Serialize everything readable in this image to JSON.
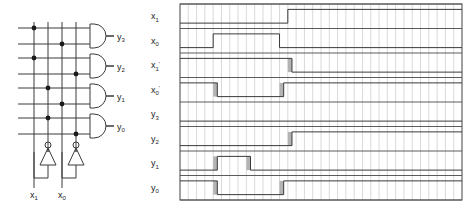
{
  "figure": {
    "title": "",
    "left_panel_name": "decoder-circuit-schematic",
    "right_panel_name": "timing-waveform-diagram"
  },
  "circuit": {
    "inputs": [
      {
        "name": "x1",
        "label": "x",
        "sub": "1"
      },
      {
        "name": "x0",
        "label": "x",
        "sub": "0"
      }
    ],
    "outputs": [
      {
        "name": "y3",
        "label": "y",
        "sub": "3"
      },
      {
        "name": "y2",
        "label": "y",
        "sub": "2"
      },
      {
        "name": "y1",
        "label": "y",
        "sub": "1"
      },
      {
        "name": "y0",
        "label": "y",
        "sub": "0"
      }
    ],
    "gates": [
      {
        "type": "and",
        "output": "y3"
      },
      {
        "type": "and",
        "output": "y2"
      },
      {
        "type": "and",
        "output": "y1"
      },
      {
        "type": "and",
        "output": "y0"
      }
    ],
    "inverters": [
      {
        "type": "not",
        "input": "x1"
      },
      {
        "type": "not",
        "input": "x0"
      }
    ],
    "vertical_rails": [
      "x1",
      "x1'",
      "x0",
      "x0'"
    ],
    "horizontal_rows": 8,
    "junction_dots": [
      {
        "row": 0,
        "rail": 0
      },
      {
        "row": 1,
        "rail": 2
      },
      {
        "row": 2,
        "rail": 0
      },
      {
        "row": 3,
        "rail": 3
      },
      {
        "row": 4,
        "rail": 1
      },
      {
        "row": 5,
        "rail": 2
      },
      {
        "row": 6,
        "rail": 1
      },
      {
        "row": 7,
        "rail": 3
      }
    ]
  },
  "timing": {
    "grid_columns": 34,
    "row_labels": [
      {
        "label": "x",
        "sub": "1",
        "prime": ""
      },
      {
        "label": "x",
        "sub": "0",
        "prime": ""
      },
      {
        "label": "x",
        "sub": "1",
        "prime": "'"
      },
      {
        "label": "x",
        "sub": "0",
        "prime": "'"
      },
      {
        "label": "y",
        "sub": "3",
        "prime": ""
      },
      {
        "label": "y",
        "sub": "2",
        "prime": ""
      },
      {
        "label": "y",
        "sub": "1",
        "prime": ""
      },
      {
        "label": "y",
        "sub": "0",
        "prime": ""
      }
    ],
    "signals": [
      {
        "name": "x1",
        "initial": 0,
        "edges": [
          {
            "t": 13.0,
            "to": 1
          }
        ],
        "glitches": []
      },
      {
        "name": "x0",
        "initial": 0,
        "edges": [
          {
            "t": 4.0,
            "to": 1
          },
          {
            "t": 12.0,
            "to": 0
          }
        ],
        "glitches": []
      },
      {
        "name": "x1p",
        "initial": 1,
        "edges": [
          {
            "t": 13.5,
            "to": 0
          }
        ],
        "glitches": [
          {
            "t": 13.0,
            "w": 0.5
          }
        ]
      },
      {
        "name": "x0p",
        "initial": 1,
        "edges": [
          {
            "t": 4.5,
            "to": 0
          },
          {
            "t": 12.5,
            "to": 1
          }
        ],
        "glitches": [
          {
            "t": 4.0,
            "w": 0.5
          },
          {
            "t": 12.0,
            "w": 0.5
          }
        ]
      },
      {
        "name": "y3",
        "initial": 0,
        "edges": [],
        "glitches": []
      },
      {
        "name": "y2",
        "initial": 0,
        "edges": [
          {
            "t": 13.5,
            "to": 1
          }
        ],
        "glitches": [
          {
            "t": 13.0,
            "w": 0.5
          }
        ]
      },
      {
        "name": "y1",
        "initial": 0,
        "edges": [
          {
            "t": 4.5,
            "to": 1
          },
          {
            "t": 8.5,
            "to": 0
          }
        ],
        "glitches": [
          {
            "t": 4.0,
            "w": 0.5
          },
          {
            "t": 8.0,
            "w": 0.5
          }
        ]
      },
      {
        "name": "y0",
        "initial": 1,
        "edges": [
          {
            "t": 4.5,
            "to": 0
          },
          {
            "t": 12.5,
            "to": 1
          }
        ],
        "glitches": [
          {
            "t": 4.0,
            "w": 0.5
          },
          {
            "t": 12.0,
            "w": 0.5
          }
        ]
      }
    ]
  },
  "colors": {
    "line": "#3a3a3a",
    "grid_minor": "#c9c9c9",
    "grid_major": "#4a4a4a",
    "glitch_fill": "#b3b3b3",
    "frame": "#555555",
    "text": "#222222",
    "background": "#ffffff"
  }
}
